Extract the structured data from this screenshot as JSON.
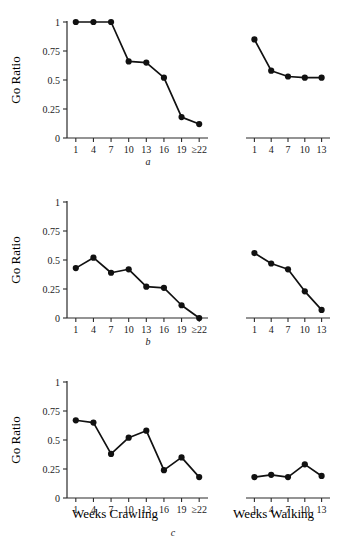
{
  "figure": {
    "panel_labels": {
      "a": "a",
      "b": "b",
      "c": "c"
    },
    "x_axis_titles": {
      "crawling": "Weeks Crawling",
      "walking": "Weeks Walking"
    },
    "y_axis_title": "Go Ratio"
  },
  "chart_data": [
    {
      "type": "line",
      "panel": "a",
      "title": "",
      "xlabel": "Weeks Crawling",
      "ylabel": "Go Ratio",
      "ylim": [
        0,
        1
      ],
      "ytick_labels": [
        "0",
        "0.25",
        "0.5",
        "0.75",
        "1"
      ],
      "ytick_values": [
        0,
        0.25,
        0.5,
        0.75,
        1
      ],
      "grid": false,
      "legend": "none",
      "categories": [
        "1",
        "4",
        "7",
        "10",
        "13",
        "16",
        "19",
        "≥22"
      ],
      "values": [
        1.0,
        1.0,
        1.0,
        0.66,
        0.65,
        0.52,
        0.18,
        0.12
      ]
    },
    {
      "type": "line",
      "panel": "a",
      "title": "",
      "xlabel": "Weeks Walking",
      "ylabel": "Go Ratio",
      "ylim": [
        0,
        1
      ],
      "grid": false,
      "legend": "none",
      "categories": [
        "1",
        "4",
        "7",
        "10",
        "13"
      ],
      "values": [
        0.85,
        0.58,
        0.53,
        0.52,
        0.52
      ]
    },
    {
      "type": "line",
      "panel": "b",
      "title": "",
      "xlabel": "Weeks Crawling",
      "ylabel": "Go Ratio",
      "ylim": [
        0,
        1
      ],
      "ytick_labels": [
        "0",
        "0.25",
        "0.5",
        "0.75",
        "1"
      ],
      "ytick_values": [
        0,
        0.25,
        0.5,
        0.75,
        1
      ],
      "grid": false,
      "legend": "none",
      "categories": [
        "1",
        "4",
        "7",
        "10",
        "13",
        "16",
        "19",
        "≥22"
      ],
      "values": [
        0.43,
        0.52,
        0.39,
        0.42,
        0.27,
        0.26,
        0.11,
        0.0
      ]
    },
    {
      "type": "line",
      "panel": "b",
      "title": "",
      "xlabel": "Weeks Walking",
      "ylabel": "Go Ratio",
      "ylim": [
        0,
        1
      ],
      "grid": false,
      "legend": "none",
      "categories": [
        "1",
        "4",
        "7",
        "10",
        "13"
      ],
      "values": [
        0.56,
        0.47,
        0.42,
        0.23,
        0.07
      ]
    },
    {
      "type": "line",
      "panel": "c",
      "title": "",
      "xlabel": "Weeks Crawling",
      "ylabel": "Go Ratio",
      "ylim": [
        0,
        1
      ],
      "ytick_labels": [
        "0",
        "0.25",
        "0.5",
        "0.75",
        "1"
      ],
      "ytick_values": [
        0,
        0.25,
        0.5,
        0.75,
        1
      ],
      "grid": false,
      "legend": "none",
      "categories": [
        "1",
        "4",
        "7",
        "10",
        "13",
        "16",
        "19",
        "≥22"
      ],
      "values": [
        0.67,
        0.65,
        0.38,
        0.52,
        0.58,
        0.24,
        0.35,
        0.18
      ]
    },
    {
      "type": "line",
      "panel": "c",
      "title": "",
      "xlabel": "Weeks Walking",
      "ylabel": "Go Ratio",
      "ylim": [
        0,
        1
      ],
      "grid": false,
      "legend": "none",
      "categories": [
        "1",
        "4",
        "7",
        "10",
        "13"
      ],
      "values": [
        0.18,
        0.2,
        0.18,
        0.29,
        0.19
      ]
    }
  ],
  "style": {
    "line_color": "#111111",
    "marker_color": "#111111",
    "axis_color": "#2b2b2b",
    "background": "#ffffff"
  }
}
